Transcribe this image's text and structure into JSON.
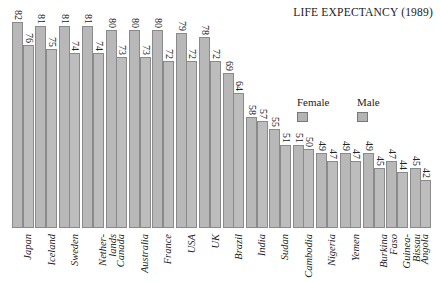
{
  "chart_data": {
    "type": "bar",
    "title": "LIFE EXPECTANCY (1989)",
    "xlabel": "",
    "ylabel": "",
    "ylim": [
      30,
      85
    ],
    "grid": false,
    "legend_position": "upper right (inside plot)",
    "categories": [
      "Japan",
      "Iceland",
      "Sweden",
      "Nether-\nlands",
      "Canada",
      "Australia",
      "France",
      "USA",
      "UK",
      "Brazil",
      "India",
      "Sudan",
      "Cambodia",
      "Nigeria",
      "Yemen",
      "Burkina\nFaso",
      "Guinea-\nBissau",
      "Angola"
    ],
    "series": [
      {
        "name": "Female",
        "values": [
          82,
          81,
          81,
          81,
          80,
          80,
          80,
          79,
          78,
          69,
          58,
          55,
          51,
          49,
          49,
          49,
          47,
          45
        ]
      },
      {
        "name": "Male",
        "values": [
          76,
          75,
          74,
          74,
          73,
          73,
          72,
          72,
          72,
          64,
          57,
          51,
          50,
          47,
          47,
          45,
          44,
          42
        ]
      }
    ],
    "data_labels": true
  },
  "legend": {
    "female_label": "Female",
    "male_label": "Male"
  },
  "colors": {
    "female_bar": "#b8b8b8",
    "male_bar": "#bdbdbd",
    "bar_border": "#8a8a8a"
  }
}
